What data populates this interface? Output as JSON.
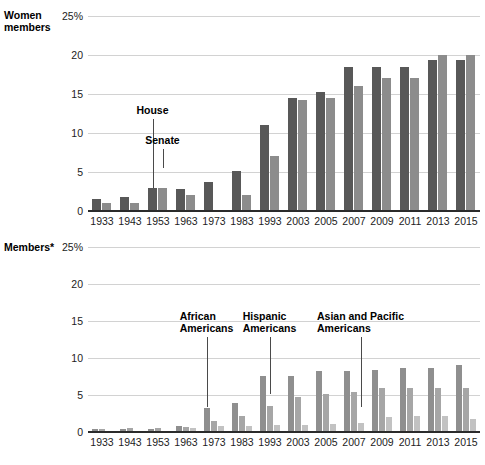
{
  "chart_data": [
    {
      "id": "women",
      "type": "bar",
      "title": "Women members",
      "xlabel": "",
      "ylabel": "",
      "ylim": [
        0,
        25
      ],
      "ytick_labels": [
        "25%",
        "20",
        "15",
        "10",
        "5",
        "0"
      ],
      "ytick_values": [
        25,
        20,
        15,
        10,
        5,
        0
      ],
      "grid": true,
      "legend_position": "annotation-callouts",
      "categories": [
        "1933",
        "1943",
        "1953",
        "1963",
        "1973",
        "1983",
        "1993",
        "2003",
        "2005",
        "2007",
        "2009",
        "2011",
        "2013",
        "2015"
      ],
      "series": [
        {
          "name": "House",
          "color": "#585858",
          "values": [
            1.6,
            1.8,
            2.9,
            2.8,
            3.7,
            5.1,
            11.0,
            14.5,
            15.2,
            18.4,
            18.4,
            18.4,
            19.3,
            19.3
          ]
        },
        {
          "name": "Senate",
          "color": "#8c8c8c",
          "values": [
            1.0,
            1.0,
            3.0,
            2.0,
            0.0,
            2.0,
            7.0,
            14.2,
            14.5,
            16.0,
            17.0,
            17.0,
            20.0,
            20.0
          ]
        }
      ],
      "annotations": [
        {
          "label": "House",
          "category": "1953",
          "series": "House",
          "value": 2.9
        },
        {
          "label": "Senate",
          "category": "1953",
          "series": "Senate",
          "value": 3.0
        }
      ]
    },
    {
      "id": "members",
      "type": "bar",
      "title": "Members*",
      "xlabel": "",
      "ylabel": "",
      "ylim": [
        0,
        25
      ],
      "ytick_labels": [
        "25%",
        "20",
        "15",
        "10",
        "5",
        "0"
      ],
      "ytick_values": [
        25,
        20,
        15,
        10,
        5,
        0
      ],
      "grid": true,
      "legend_position": "annotation-callouts",
      "categories": [
        "1933",
        "1943",
        "1953",
        "1963",
        "1973",
        "1983",
        "1993",
        "2003",
        "2005",
        "2007",
        "2009",
        "2011",
        "2013",
        "2015"
      ],
      "series": [
        {
          "name": "African Americans",
          "color": "#8f8f8f",
          "values": [
            0.4,
            0.4,
            0.4,
            0.8,
            3.2,
            3.9,
            7.6,
            7.6,
            8.2,
            8.2,
            8.4,
            8.6,
            8.6,
            9.1
          ]
        },
        {
          "name": "Hispanic Americans",
          "color": "#a6a6a6",
          "values": [
            0.4,
            0.5,
            0.5,
            0.7,
            1.5,
            2.1,
            3.5,
            4.7,
            5.1,
            5.4,
            5.9,
            6.0,
            5.9,
            6.0
          ]
        },
        {
          "name": "Asian and Pacific Americans",
          "color": "#c2c2c2",
          "values": [
            0.0,
            0.0,
            0.0,
            0.5,
            0.8,
            0.8,
            1.0,
            0.9,
            1.1,
            1.2,
            2.0,
            2.1,
            2.1,
            1.8
          ]
        }
      ],
      "annotations": [
        {
          "label": "African\nAmericans",
          "category": "1973",
          "series": "African Americans"
        },
        {
          "label": "Hispanic\nAmericans",
          "category": "1993",
          "series": "Hispanic Americans"
        },
        {
          "label": "Asian and Pacific\nAmericans",
          "category": "2007",
          "series": "Asian and Pacific Americans"
        }
      ]
    }
  ],
  "panels": {
    "women": {
      "title_line1": "Women",
      "title_line2": "members"
    },
    "members": {
      "title_line1": "Members*",
      "title_line2": ""
    }
  },
  "colors": {
    "house": "#585858",
    "senate": "#8c8c8c",
    "african_americans": "#8f8f8f",
    "hispanic_americans": "#a6a6a6",
    "asian_pacific_americans": "#c2c2c2",
    "gridline": "#d2d2d2",
    "axis": "#2b2b2b",
    "text": "#1a1a1a",
    "background": "#ffffff"
  }
}
